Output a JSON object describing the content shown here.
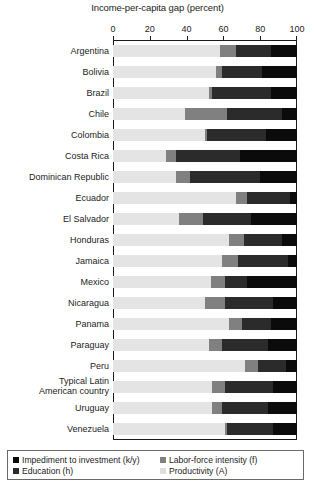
{
  "chart_data": {
    "type": "bar",
    "orientation": "horizontal",
    "stacked": true,
    "title": "Income-per-capita gap (percent)",
    "xlabel": "Income-per-capita gap (percent)",
    "ylabel": "",
    "xlim": [
      0,
      100
    ],
    "xticks": [
      0,
      20,
      40,
      60,
      80,
      100
    ],
    "xtick_labels": [
      "0",
      "20",
      "40",
      "60",
      "80",
      "100"
    ],
    "grid": false,
    "legend_position": "bottom",
    "categories": [
      "Argentina",
      "Bolivia",
      "Brazil",
      "Chile",
      "Colombia",
      "Costa Rica",
      "Dominican Republic",
      "Ecuador",
      "El Salvador",
      "Honduras",
      "Jamaica",
      "Mexico",
      "Nicaragua",
      "Panama",
      "Paraguay",
      "Peru",
      "Typical Latin American country",
      "Uruguay",
      "Venezuela"
    ],
    "series": [
      {
        "name": "Productivity (A)",
        "key": "A",
        "color": "#e4e4e4",
        "values": [
          58,
          56,
          52,
          39,
          50,
          29,
          34,
          67,
          36,
          63,
          59,
          53,
          50,
          63,
          52,
          72,
          54,
          54,
          61
        ]
      },
      {
        "name": "Labor-force intensity (f)",
        "key": "f",
        "color": "#808080",
        "values": [
          9,
          3,
          2,
          23,
          1,
          5,
          8,
          6,
          13,
          8,
          9,
          8,
          11,
          7,
          7,
          7,
          7,
          5,
          1
        ]
      },
      {
        "name": "Education (h)",
        "key": "h",
        "color": "#2b2b2b",
        "values": [
          19,
          22,
          32,
          30,
          32,
          35,
          38,
          23,
          26,
          21,
          27,
          12,
          26,
          16,
          25,
          15,
          26,
          25,
          25
        ]
      },
      {
        "name": "Impediment to investment (k/y)",
        "key": "ky",
        "color": "#0b0b0b",
        "values": [
          14,
          19,
          14,
          8,
          17,
          31,
          20,
          4,
          25,
          8,
          5,
          27,
          13,
          14,
          16,
          6,
          13,
          16,
          13
        ]
      }
    ]
  },
  "legend": {
    "items": [
      {
        "label": "Impediment to investment (k/y)",
        "color": "#0b0b0b"
      },
      {
        "label": "Education (h)",
        "color": "#2b2b2b"
      },
      {
        "label": "Labor-force intensity (f)",
        "color": "#808080"
      },
      {
        "label": "Productivity (A)",
        "color": "#dedede"
      }
    ]
  }
}
